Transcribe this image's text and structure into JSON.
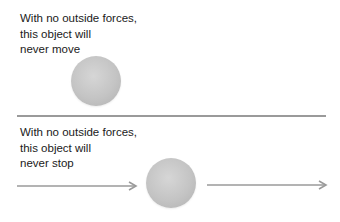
{
  "panels": [
    {
      "id": "stationary",
      "caption_lines": [
        "With no outside forces,",
        "this object will",
        "never move"
      ]
    },
    {
      "id": "moving",
      "caption_lines": [
        "With no outside forces,",
        "this object will",
        "never stop"
      ]
    }
  ],
  "colors": {
    "ball": "#c4c4c4",
    "arrow": "#9a9a9a",
    "divider": "#9a9a9a",
    "text": "#1a1a1a"
  }
}
